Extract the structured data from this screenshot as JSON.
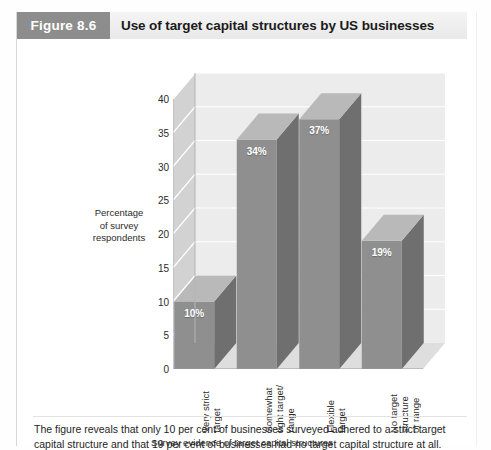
{
  "running_head": "",
  "figure": {
    "tag": "Figure 8.6",
    "title": "Use of target capital structures by US businesses",
    "caption": "The figure reveals that only 10 per cent of businesses surveyed adhered to a strict target capital structure and that 19 per cent of businesses had no target capital structure at all."
  },
  "colors": {
    "tag_background": "#8d8d8d",
    "header_background": "#eeeeee",
    "bar_front": "#8f8f8f",
    "bar_side": "#6f6f6f",
    "bar_top": "#b9b9b9",
    "wall": "#ececec",
    "gridline": "#ffffff",
    "text": "#231f20"
  },
  "chart_data": {
    "type": "bar",
    "title": "Use of target capital structures by US businesses",
    "subtitle": "",
    "categories": [
      "Very strict\ntarget",
      "Somewhat\ntight target/\nrange",
      "Flexible\ntarget",
      "No target\nstructure\nor range"
    ],
    "category_labels_flat": [
      "Very strict target",
      "Somewhat tight target/ range",
      "Flexible target",
      "No target structure or range"
    ],
    "values": [
      10,
      34,
      37,
      19
    ],
    "data_labels": [
      "10%",
      "34%",
      "37%",
      "19%"
    ],
    "xlabel": "Survey evidence of target capital structures",
    "ylabel": "Percentage of survey respondents",
    "ylabel_lines": [
      "Percentage",
      "of survey",
      "respondents"
    ],
    "ylim": [
      0,
      40
    ],
    "ytick_step": 5,
    "yticks": [
      40,
      35,
      30,
      25,
      20,
      15,
      10,
      5,
      0
    ],
    "ytick_labels": [
      "40",
      "35",
      "30",
      "25",
      "20",
      "15",
      "10",
      "5",
      "0"
    ],
    "grid": true,
    "grid_axis": "y",
    "legend": false,
    "legend_position": "none",
    "three_d": true,
    "units": "per cent"
  }
}
